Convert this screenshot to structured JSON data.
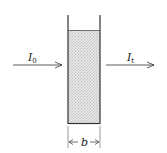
{
  "diagram": {
    "title": "",
    "incident_beam": {
      "symbol": "I",
      "subscript": "0"
    },
    "transmitted_beam": {
      "symbol": "I",
      "subscript": "t"
    },
    "path_length": {
      "symbol": "b"
    },
    "colors": {
      "line": "#333333",
      "fill": "#d9d9d9",
      "background": "#ffffff"
    }
  }
}
